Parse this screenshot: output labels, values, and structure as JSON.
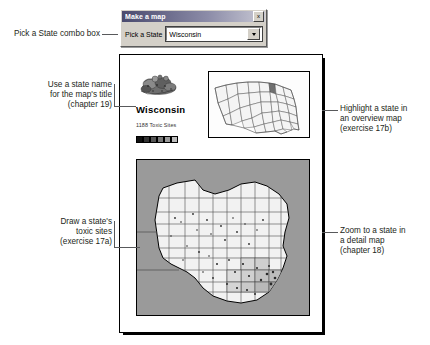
{
  "dialog": {
    "title": "Make a map",
    "close_label": "x",
    "combo_label": "Pick a State",
    "combo_value": "Wisconsin",
    "dropdown_icon": "chevron-down-icon"
  },
  "callouts": [
    {
      "id": "combo-callout",
      "text": "Pick a State combo box"
    },
    {
      "id": "title-callout",
      "text": "Use a state name\nfor the map's title\n(chapter 19)"
    },
    {
      "id": "toxic-callout",
      "text": "Draw a state's\ntoxic sites\n(exercise 17a)"
    },
    {
      "id": "overview-callout",
      "text": "Highlight a state in\nan overview map\n(exercise 17b)"
    },
    {
      "id": "detail-callout",
      "text": "Zoom to a state in\na detail map\n(chapter 18)"
    }
  ],
  "map_page": {
    "title": "Wisconsin",
    "subtitle": "1188 Toxic Sites",
    "legend_name": "graduated-color-legend",
    "overview_map_name": "us-overview-map",
    "overview_highlight_state": "Wisconsin",
    "detail_map_name": "wisconsin-county-detail-map"
  },
  "colors": {
    "highlight": "#6f6f6f",
    "water": "#9a9a9a",
    "land": "#f2f2f2",
    "outline": "#000000",
    "leader": "#58595b",
    "text": "#231f20",
    "titlebar_start": "#4a4a6e",
    "dialog_face": "#d4d0c8"
  }
}
